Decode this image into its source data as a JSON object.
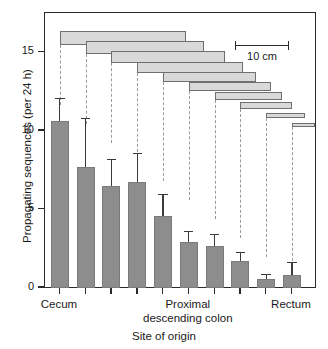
{
  "chart_data": {
    "type": "bar",
    "title": "",
    "xlabel": "Site of origin",
    "ylabel": "Propagating sequences (per 24 h)",
    "ylim": [
      0,
      17.5
    ],
    "yticks": [
      0,
      5,
      10,
      15
    ],
    "ytick_labels": [
      "0",
      "5",
      "10",
      "15"
    ],
    "grid": false,
    "legend": false,
    "categories": [
      "1",
      "2",
      "3",
      "4",
      "5",
      "6",
      "7",
      "8",
      "9",
      "10"
    ],
    "category_axis_labels": [
      {
        "text": "Cecum",
        "at_category": 1
      },
      {
        "text": "Proximal",
        "at_category": 6
      },
      {
        "text": "descending colon",
        "at_category": 6
      },
      {
        "text": "Rectum",
        "at_category": 10
      }
    ],
    "series": [
      {
        "name": "Propagating sequences",
        "values": [
          10.6,
          7.7,
          6.5,
          6.75,
          4.6,
          2.95,
          2.7,
          1.7,
          0.6,
          0.85
        ],
        "errors_upper": [
          1.5,
          3.15,
          1.7,
          1.85,
          1.4,
          0.7,
          0.75,
          0.6,
          0.3,
          0.8
        ],
        "error_type": "SEM"
      }
    ],
    "annotations": {
      "scale_bar": {
        "label": "10 cm",
        "length_cm": 10
      },
      "overlay_description": "Cascading horizontal bars showing extent of propagating sequences from each site of origin, connected by dashed drop-lines to the corresponding site on the x-axis.",
      "overlay_bars": [
        {
          "start_cat": 1,
          "span_cat": 4.9,
          "thickness": 14
        },
        {
          "start_cat": 2,
          "span_cat": 4.6,
          "thickness": 13
        },
        {
          "start_cat": 3,
          "span_cat": 4.4,
          "thickness": 12
        },
        {
          "start_cat": 4,
          "span_cat": 4.1,
          "thickness": 11
        },
        {
          "start_cat": 5,
          "span_cat": 3.6,
          "thickness": 10
        },
        {
          "start_cat": 6,
          "span_cat": 3.2,
          "thickness": 9
        },
        {
          "start_cat": 7,
          "span_cat": 2.6,
          "thickness": 8
        },
        {
          "start_cat": 8,
          "span_cat": 2.0,
          "thickness": 7
        },
        {
          "start_cat": 9,
          "span_cat": 1.5,
          "thickness": 5
        },
        {
          "start_cat": 10,
          "span_cat": 0.9,
          "thickness": 4
        }
      ]
    }
  }
}
